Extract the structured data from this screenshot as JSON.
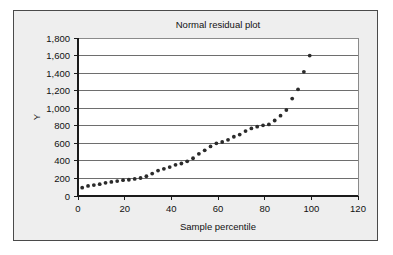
{
  "chart_data": {
    "type": "scatter",
    "title": "Normal residual plot",
    "xlabel": "Sample percentile",
    "ylabel": "Y",
    "xlim": [
      0,
      120
    ],
    "ylim": [
      0,
      1800
    ],
    "xticks": [
      0,
      20,
      40,
      60,
      80,
      100,
      120
    ],
    "xtick_labels": [
      "0",
      "20",
      "40",
      "60",
      "80",
      "100",
      "120"
    ],
    "yticks": [
      0,
      200,
      400,
      600,
      800,
      1000,
      1200,
      1400,
      1600,
      1800
    ],
    "ytick_labels": [
      "0",
      "200",
      "400",
      "600",
      "800",
      "1,000",
      "1,200",
      "1,400",
      "1,600",
      "1,800"
    ],
    "grid": "horizontal",
    "legend": "none",
    "marker": "filled-circle",
    "marker_color": "#2b2b2b",
    "series": [
      {
        "name": "Residuals",
        "x": [
          1.8,
          4.3,
          6.8,
          9.3,
          11.8,
          14.3,
          16.8,
          19.3,
          21.8,
          24.3,
          26.8,
          29.3,
          31.8,
          34.3,
          36.8,
          39.3,
          41.8,
          44.3,
          46.8,
          49.3,
          51.8,
          54.3,
          56.8,
          59.3,
          61.8,
          64.3,
          66.8,
          69.3,
          71.8,
          74.3,
          76.8,
          79.3,
          81.8,
          84.3,
          86.8,
          89.3,
          91.8,
          94.3,
          96.8,
          99.3
        ],
        "y": [
          95,
          115,
          125,
          135,
          150,
          160,
          170,
          180,
          185,
          195,
          205,
          225,
          255,
          290,
          310,
          330,
          355,
          370,
          395,
          430,
          480,
          520,
          565,
          600,
          615,
          640,
          675,
          700,
          740,
          770,
          790,
          805,
          815,
          860,
          915,
          980,
          1110,
          1215,
          1415,
          1600
        ]
      }
    ]
  }
}
